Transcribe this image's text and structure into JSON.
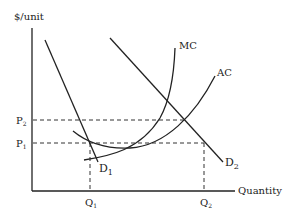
{
  "diagram": {
    "title": "",
    "y_axis_label": "$/unit",
    "x_axis_label": "Quantity",
    "curves": {
      "mc": "MC",
      "ac": "AC",
      "d1": "D",
      "d1_sub": "1",
      "d2": "D",
      "d2_sub": "2"
    },
    "price_levels": [
      {
        "label": "P",
        "sub": "2"
      },
      {
        "label": "P",
        "sub": "1"
      }
    ],
    "quantities": [
      {
        "label": "Q",
        "sub": "1"
      },
      {
        "label": "Q",
        "sub": "2"
      }
    ],
    "colors": {
      "line": "#222222",
      "background": "#ffffff"
    }
  }
}
